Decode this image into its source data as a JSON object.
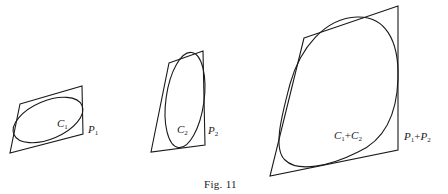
{
  "figure": {
    "caption": "Fig. 11",
    "panels": [
      {
        "curve_label": {
          "symbol": "C",
          "subscript": "1"
        },
        "polygon_label": {
          "symbol": "P",
          "subscript": "1"
        }
      },
      {
        "curve_label": {
          "symbol": "C",
          "subscript": "2"
        },
        "polygon_label": {
          "symbol": "P",
          "subscript": "2"
        }
      },
      {
        "curve_label": {
          "symbol": "C",
          "subscript": "1",
          "op": "+",
          "symbol2": "C",
          "subscript2": "2"
        },
        "polygon_label": {
          "symbol": "P",
          "subscript": "1",
          "op": "+",
          "symbol2": "P",
          "subscript2": "2"
        }
      }
    ],
    "stroke_color": "#1a1a1a"
  }
}
